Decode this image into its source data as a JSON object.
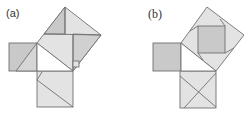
{
  "figures": [
    {
      "id": "a",
      "label": "(a)",
      "description": "Pythagorean dissection: squares on legs and hypotenuse of right triangle, hypotenuse square split into pieces"
    },
    {
      "id": "b",
      "label": "(b)",
      "description": "Pythagorean dissection: tilted hypotenuse square containing inner shaded square, leg square divided by crossing lines"
    }
  ],
  "colors": {
    "dark_fill": "#c9c9c9",
    "light_fill": "#e3e3e3",
    "stroke": "#707070",
    "background": "#ffffff"
  }
}
